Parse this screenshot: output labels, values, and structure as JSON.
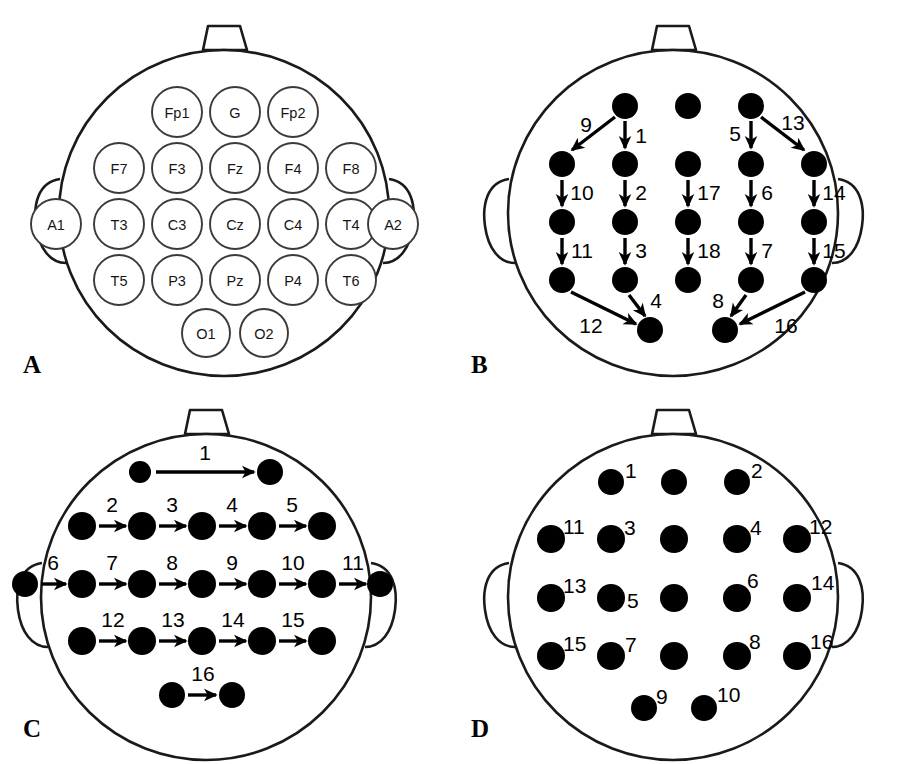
{
  "figure": {
    "width": 899,
    "height": 764,
    "background": "#ffffff",
    "ink_color": "#000000",
    "outline_color": "#1a1a1a",
    "circle_stroke_color": "#3a3a3a"
  },
  "panels": [
    {
      "id": "A",
      "letter": "A",
      "caption": "",
      "kind": "electrode-map"
    },
    {
      "id": "B",
      "letter": "B",
      "caption": "",
      "kind": "longitudinal-bipolar-montage"
    },
    {
      "id": "C",
      "letter": "C",
      "caption": "",
      "kind": "transverse-bipolar-montage"
    },
    {
      "id": "D",
      "letter": "D",
      "caption": "",
      "kind": "referential-montage"
    }
  ],
  "panel_a": {
    "letter": "A",
    "electrodes": [
      {
        "label": "Fp1",
        "col": 1,
        "row": 0
      },
      {
        "label": "G",
        "col": 2,
        "row": 0
      },
      {
        "label": "Fp2",
        "col": 3,
        "row": 0
      },
      {
        "label": "F7",
        "col": 0,
        "row": 1
      },
      {
        "label": "F3",
        "col": 1,
        "row": 1
      },
      {
        "label": "Fz",
        "col": 2,
        "row": 1
      },
      {
        "label": "F4",
        "col": 3,
        "row": 1
      },
      {
        "label": "F8",
        "col": 4,
        "row": 1
      },
      {
        "label": "T3",
        "col": 0,
        "row": 2
      },
      {
        "label": "C3",
        "col": 1,
        "row": 2
      },
      {
        "label": "Cz",
        "col": 2,
        "row": 2
      },
      {
        "label": "C4",
        "col": 3,
        "row": 2
      },
      {
        "label": "T4",
        "col": 4,
        "row": 2
      },
      {
        "label": "T5",
        "col": 0,
        "row": 3
      },
      {
        "label": "P3",
        "col": 1,
        "row": 3
      },
      {
        "label": "Pz",
        "col": 2,
        "row": 3
      },
      {
        "label": "P4",
        "col": 3,
        "row": 3
      },
      {
        "label": "T6",
        "col": 4,
        "row": 3
      },
      {
        "label": "O1",
        "col": 1.5,
        "row": 4
      },
      {
        "label": "O2",
        "col": 2.5,
        "row": 4
      }
    ],
    "ear_electrodes": [
      {
        "label": "A1",
        "side": "left"
      },
      {
        "label": "A2",
        "side": "right"
      }
    ]
  },
  "panel_b": {
    "letter": "B",
    "arrow_numbers": [
      "1",
      "2",
      "3",
      "4",
      "5",
      "6",
      "7",
      "8",
      "9",
      "10",
      "11",
      "12",
      "13",
      "14",
      "15",
      "16",
      "17",
      "18"
    ],
    "chains": [
      {
        "numbers": [
          "9",
          "10",
          "11",
          "12"
        ],
        "description": "left temporal chain Fp1-F7-T3-T5-O1"
      },
      {
        "numbers": [
          "1",
          "2",
          "3",
          "4"
        ],
        "description": "left parasagittal chain Fp1-F3-C3-P3-O1"
      },
      {
        "numbers": [
          "17",
          "18"
        ],
        "description": "midline chain Fz-Cz-Pz"
      },
      {
        "numbers": [
          "5",
          "6",
          "7",
          "8"
        ],
        "description": "right parasagittal chain Fp2-F4-C4-P4-O2"
      },
      {
        "numbers": [
          "13",
          "14",
          "15",
          "16"
        ],
        "description": "right temporal chain Fp2-F8-T4-T6-O2"
      }
    ]
  },
  "panel_c": {
    "letter": "C",
    "arrow_numbers": [
      "1",
      "2",
      "3",
      "4",
      "5",
      "6",
      "7",
      "8",
      "9",
      "10",
      "11",
      "12",
      "13",
      "14",
      "15",
      "16"
    ],
    "chains": [
      {
        "numbers": [
          "1"
        ],
        "description": "frontopolar transverse Fp1-Fp2"
      },
      {
        "numbers": [
          "2",
          "3",
          "4",
          "5"
        ],
        "description": "frontal transverse F7-F3-Fz-F4-F8"
      },
      {
        "numbers": [
          "6",
          "7",
          "8",
          "9",
          "10",
          "11"
        ],
        "description": "central transverse A1-T3-C3-Cz-C4-T4-A2"
      },
      {
        "numbers": [
          "12",
          "13",
          "14",
          "15"
        ],
        "description": "parietal transverse T5-P3-Pz-P4-T6"
      },
      {
        "numbers": [
          "16"
        ],
        "description": "occipital transverse O1-O2"
      }
    ]
  },
  "panel_d": {
    "letter": "D",
    "dot_numbers": [
      "1",
      "2",
      "3",
      "4",
      "5",
      "6",
      "7",
      "8",
      "9",
      "10",
      "11",
      "12",
      "13",
      "14",
      "15",
      "16"
    ],
    "labeled_positions": [
      {
        "number": "1",
        "electrode": "Fp1"
      },
      {
        "number": "2",
        "electrode": "Fp2"
      },
      {
        "number": "3",
        "electrode": "F3"
      },
      {
        "number": "4",
        "electrode": "F4"
      },
      {
        "number": "5",
        "electrode": "C3"
      },
      {
        "number": "6",
        "electrode": "C4"
      },
      {
        "number": "7",
        "electrode": "P3"
      },
      {
        "number": "8",
        "electrode": "P4"
      },
      {
        "number": "9",
        "electrode": "O1"
      },
      {
        "number": "10",
        "electrode": "O2"
      },
      {
        "number": "11",
        "electrode": "F7"
      },
      {
        "number": "12",
        "electrode": "F8"
      },
      {
        "number": "13",
        "electrode": "T3"
      },
      {
        "number": "14",
        "electrode": "T4"
      },
      {
        "number": "15",
        "electrode": "T5"
      },
      {
        "number": "16",
        "electrode": "T6"
      }
    ],
    "unlabeled_positions": [
      "G",
      "Fz",
      "Cz",
      "Pz"
    ]
  }
}
